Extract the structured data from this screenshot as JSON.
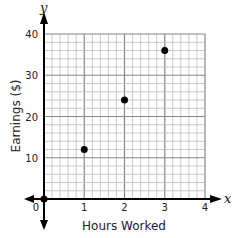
{
  "chart_data": {
    "type": "scatter",
    "title": "",
    "xlabel": "Hours Worked",
    "ylabel": "Earnings ($)",
    "x_axis_name": "x",
    "y_axis_name": "y",
    "xlim": [
      0,
      4
    ],
    "ylim": [
      0,
      40
    ],
    "x_ticks": [
      "0",
      "1",
      "2",
      "3",
      "4"
    ],
    "y_ticks": [
      "10",
      "20",
      "30",
      "40"
    ],
    "grid": true,
    "grid_minor_x_step": 0.2,
    "grid_minor_y_step": 2,
    "points": [
      {
        "x": 0,
        "y": 0
      },
      {
        "x": 1,
        "y": 12
      },
      {
        "x": 2,
        "y": 24
      },
      {
        "x": 3,
        "y": 36
      }
    ],
    "point_color": "#000000"
  }
}
